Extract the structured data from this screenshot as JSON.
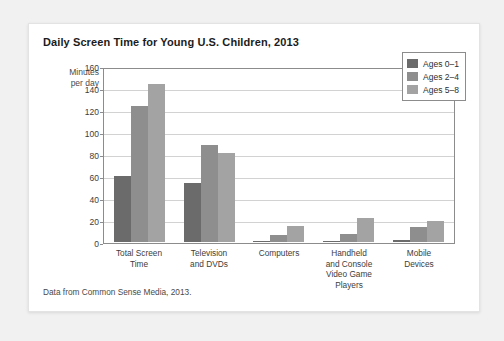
{
  "chart_data": {
    "type": "bar",
    "title": "Daily Screen Time for Young U.S. Children, 2013",
    "ylabel": "Minutes per day",
    "ylabel_lines": [
      "Minutes",
      "per day"
    ],
    "xlabel": "",
    "ylim": [
      0,
      160
    ],
    "yticks": [
      0,
      20,
      40,
      60,
      80,
      100,
      120,
      140,
      160
    ],
    "grid": true,
    "legend_position": "top-right",
    "categories": [
      "Total Screen Time",
      "Television and DVDs",
      "Computers",
      "Handheld and Console Video Game Players",
      "Mobile Devices"
    ],
    "category_lines": [
      [
        "Total Screen",
        "Time"
      ],
      [
        "Television",
        "and DVDs"
      ],
      [
        "Computers"
      ],
      [
        "Handheld",
        "and Console",
        "Video Game",
        "Players"
      ],
      [
        "Mobile",
        "Devices"
      ]
    ],
    "series": [
      {
        "name": "Ages 0–1",
        "color": "#6b6b6b",
        "values": [
          61,
          54,
          1,
          1,
          2
        ]
      },
      {
        "name": "Ages 2–4",
        "color": "#8e8e8e",
        "values": [
          125,
          89,
          6,
          7,
          14
        ]
      },
      {
        "name": "Ages 5–8",
        "color": "#a3a3a3",
        "values": [
          145,
          82,
          15,
          22,
          19
        ]
      }
    ],
    "source_note": "Data from Common Sense Media, 2013."
  }
}
